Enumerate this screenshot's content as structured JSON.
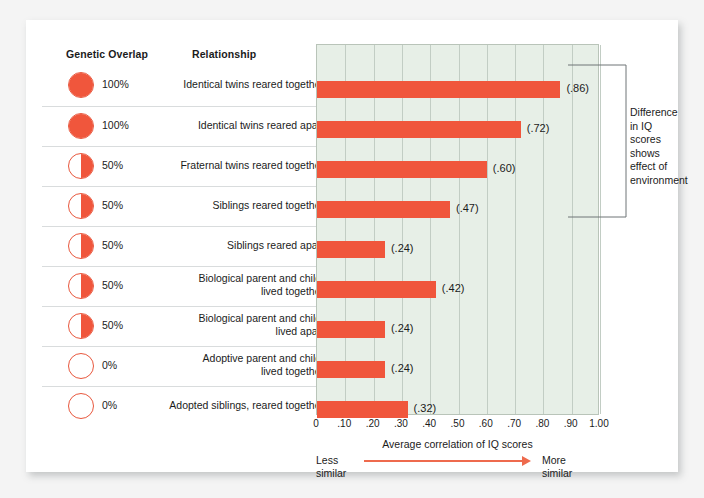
{
  "headers": {
    "genetic_overlap": "Genetic Overlap",
    "relationship": "Relationship"
  },
  "annotation": {
    "text": "Difference in IQ scores shows effect of environment"
  },
  "axis": {
    "title": "Average correlation of IQ scores",
    "less_similar": "Less\nsimilar",
    "less_similar_line1": "Less",
    "less_similar_line2": "similar",
    "more_similar_line1": "More",
    "more_similar_line2": "similar",
    "ticks": [
      "0",
      ".10",
      ".20",
      ".30",
      ".40",
      ".50",
      ".60",
      ".70",
      ".80",
      ".90",
      "1.00"
    ]
  },
  "colors": {
    "bar": "#f0563c",
    "plot_background": "#e7efe7",
    "gridline": "#c2cdc4",
    "arrow": "#ee6a4d",
    "card": "#ffffff",
    "page": "#f4f4f4"
  },
  "chart_data": {
    "type": "bar",
    "title": "",
    "xlabel": "Average correlation of IQ scores",
    "ylabel": "",
    "xlim": [
      0,
      1.0
    ],
    "grid": true,
    "orientation": "horizontal",
    "legend": "none",
    "categories": [
      "Identical twins reared together",
      "Identical twins reared apart",
      "Fraternal twins reared together",
      "Siblings reared together",
      "Siblings reared apart",
      "Biological parent and child, lived together",
      "Biological parent and child, lived apart",
      "Adoptive parent and child, lived together",
      "Adopted siblings, reared together"
    ],
    "values": [
      0.86,
      0.72,
      0.6,
      0.47,
      0.24,
      0.42,
      0.24,
      0.24,
      0.32
    ],
    "value_labels": [
      "(.86)",
      "(.72)",
      "(.60)",
      "(.47)",
      "(.24)",
      "(.42)",
      "(.24)",
      "(.24)",
      "(.32)"
    ],
    "genetic_overlap": [
      "100%",
      "100%",
      "50%",
      "50%",
      "50%",
      "50%",
      "50%",
      "0%",
      "0%"
    ],
    "genetic_overlap_fraction": [
      1.0,
      1.0,
      0.5,
      0.5,
      0.5,
      0.5,
      0.5,
      0.0,
      0.0
    ],
    "annotations": [
      "Difference in IQ scores shows effect of environment"
    ]
  },
  "rows": [
    {
      "pct": "100%",
      "fill": 1.0,
      "label_line1": "Identical twins reared together",
      "label_line2": "",
      "value": "(.86)",
      "v": 0.86
    },
    {
      "pct": "100%",
      "fill": 1.0,
      "label_line1": "Identical twins reared apart",
      "label_line2": "",
      "value": "(.72)",
      "v": 0.72
    },
    {
      "pct": "50%",
      "fill": 0.5,
      "label_line1": "Fraternal twins reared together",
      "label_line2": "",
      "value": "(.60)",
      "v": 0.6
    },
    {
      "pct": "50%",
      "fill": 0.5,
      "label_line1": "Siblings reared together",
      "label_line2": "",
      "value": "(.47)",
      "v": 0.47
    },
    {
      "pct": "50%",
      "fill": 0.5,
      "label_line1": "Siblings reared apart",
      "label_line2": "",
      "value": "(.24)",
      "v": 0.24
    },
    {
      "pct": "50%",
      "fill": 0.5,
      "label_line1": "Biological parent and child,",
      "label_line2": "lived together",
      "value": "(.42)",
      "v": 0.42
    },
    {
      "pct": "50%",
      "fill": 0.5,
      "label_line1": "Biological parent and child,",
      "label_line2": "lived apart",
      "value": "(.24)",
      "v": 0.24
    },
    {
      "pct": "0%",
      "fill": 0.0,
      "label_line1": "Adoptive parent and child,",
      "label_line2": "lived together",
      "value": "(.24)",
      "v": 0.24
    },
    {
      "pct": "0%",
      "fill": 0.0,
      "label_line1": "Adopted siblings, reared together",
      "label_line2": "",
      "value": "(.32)",
      "v": 0.32
    }
  ]
}
